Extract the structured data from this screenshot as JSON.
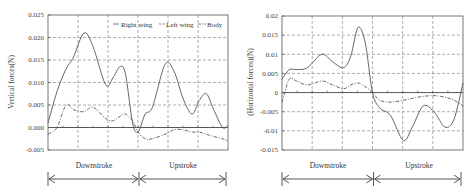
{
  "chart_data": [
    {
      "type": "line",
      "title": "",
      "xlabel": "",
      "ylabel": "Vertical forces(N)",
      "ylim": [
        -0.005,
        0.025
      ],
      "yticks": [
        "0.025",
        "0.020",
        "0.015",
        "0.010",
        "0.005",
        "0.000",
        "-0.005"
      ],
      "ytick_values": [
        0.025,
        0.02,
        0.015,
        0.01,
        0.005,
        0.0,
        -0.005
      ],
      "grid": true,
      "legend": {
        "position": "top-right",
        "entries": [
          "Right wing",
          "Left wing",
          "Body"
        ]
      },
      "x_normalized": [
        0,
        0.05,
        0.1,
        0.14,
        0.2,
        0.25,
        0.32,
        0.36,
        0.4,
        0.43,
        0.47,
        0.5,
        0.54,
        0.58,
        0.65,
        0.7,
        0.75,
        0.8,
        0.84,
        0.88,
        0.92,
        0.97,
        1.0
      ],
      "series": [
        {
          "name": "Right wing",
          "style": "solid",
          "values": [
            0.001,
            0.008,
            0.013,
            0.0155,
            0.021,
            0.018,
            0.0095,
            0.011,
            0.0135,
            0.012,
            0.001,
            -0.001,
            0.003,
            0.0045,
            0.014,
            0.0125,
            0.0065,
            0.003,
            0.006,
            0.0075,
            0.004,
            0.0,
            0.0005
          ]
        },
        {
          "name": "Body",
          "style": "dash-dot",
          "values": [
            -0.0015,
            0.0,
            0.005,
            0.004,
            0.0035,
            0.0045,
            0.002,
            0.0015,
            0.0025,
            0.003,
            0.0015,
            -0.001,
            -0.0025,
            -0.0025,
            -0.0015,
            -0.0005,
            -0.0005,
            -0.001,
            -0.001,
            -0.0015,
            -0.002,
            -0.0025,
            -0.003
          ]
        }
      ],
      "phase_annotations": [
        {
          "label": "Downstroke",
          "from": 0.0,
          "to": 0.5
        },
        {
          "label": "Upstroke",
          "from": 0.5,
          "to": 1.0
        }
      ]
    },
    {
      "type": "line",
      "title": "",
      "xlabel": "",
      "ylabel": "(Horizontal forces)(N)",
      "ylim": [
        -0.015,
        0.02
      ],
      "yticks": [
        "0.02",
        "0.015",
        "0.01",
        "0.005",
        "0",
        "-0.005",
        "-0.01",
        "-0.015"
      ],
      "ytick_values": [
        0.02,
        0.015,
        0.01,
        0.005,
        0.0,
        -0.005,
        -0.01,
        -0.015
      ],
      "grid": true,
      "x_normalized": [
        0,
        0.04,
        0.08,
        0.14,
        0.22,
        0.28,
        0.34,
        0.38,
        0.42,
        0.46,
        0.5,
        0.54,
        0.6,
        0.67,
        0.72,
        0.78,
        0.84,
        0.9,
        0.95,
        1.0
      ],
      "series": [
        {
          "name": "Right wing",
          "style": "solid",
          "values": [
            0.0035,
            0.006,
            0.006,
            0.0065,
            0.01,
            0.008,
            0.0065,
            0.0095,
            0.017,
            0.013,
            0.0,
            -0.004,
            -0.006,
            -0.0125,
            -0.009,
            -0.0035,
            -0.005,
            -0.009,
            -0.007,
            0.0025
          ]
        },
        {
          "name": "Body",
          "style": "dash-dot",
          "values": [
            -0.0025,
            0.0035,
            0.003,
            0.002,
            0.003,
            0.002,
            0.001,
            0.002,
            0.0025,
            0.0015,
            0.0,
            -0.002,
            -0.0025,
            -0.002,
            -0.0015,
            -0.001,
            -0.0008,
            -0.0012,
            -0.002,
            -0.0035
          ]
        }
      ],
      "phase_annotations": [
        {
          "label": "Downstroke",
          "from": 0.0,
          "to": 0.5
        },
        {
          "label": "Upstroke",
          "from": 0.5,
          "to": 1.0
        }
      ]
    }
  ],
  "left": {
    "ylabel": "Vertical forces(N)",
    "legend": {
      "right_wing": "Right wing",
      "left_wing": "Left wing",
      "body": "Body"
    },
    "down_label": "Downstroke",
    "up_label": "Upstroke"
  },
  "right": {
    "ylabel": "(Horizontal forces)(N)",
    "down_label": "Downstroke",
    "up_label": "Upstroke"
  }
}
